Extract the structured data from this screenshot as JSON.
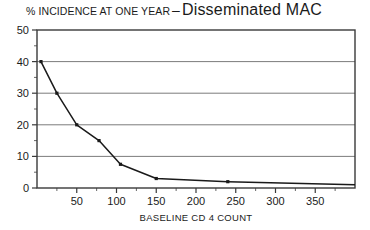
{
  "title": {
    "prefix": "% INCIDENCE AT ONE YEAR",
    "dash": "–",
    "main": "Disseminated  MAC"
  },
  "chart_data": {
    "type": "line",
    "title": "% INCIDENCE AT ONE YEAR – Disseminated MAC",
    "xlabel": "BASELINE CD 4 COUNT",
    "ylabel": "",
    "xlim": [
      0,
      400
    ],
    "ylim": [
      0,
      50
    ],
    "grid": true,
    "grid_axis": "y",
    "legend": "none",
    "xticks": [
      0,
      50,
      100,
      150,
      200,
      250,
      300,
      350
    ],
    "xticklabels": [
      "",
      "50",
      "100",
      "150",
      "200",
      "250",
      "300",
      "350"
    ],
    "xminorticks": [
      25,
      75,
      125,
      175,
      225,
      275,
      325,
      375
    ],
    "yticks": [
      0,
      10,
      20,
      30,
      40,
      50
    ],
    "yticklabels": [
      "0",
      "10",
      "20",
      "30",
      "40",
      "50"
    ],
    "yminorticks": [
      5,
      15,
      25,
      35,
      45
    ],
    "series": [
      {
        "name": "Disseminated MAC incidence",
        "marker": "square",
        "color": "#1a1a1a",
        "x": [
          5,
          25,
          50,
          78,
          105,
          150,
          240,
          400
        ],
        "y": [
          40,
          30,
          20,
          15,
          7.5,
          3,
          2,
          1
        ]
      }
    ]
  }
}
